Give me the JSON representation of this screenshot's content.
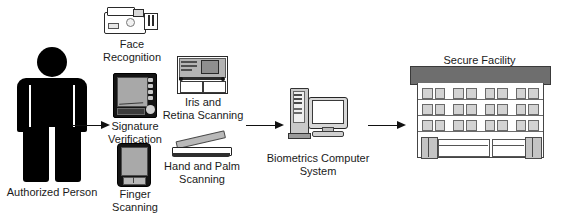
{
  "diagram": {
    "nodes": {
      "person": {
        "label": "Authorized Person",
        "icon": "person-silhouette-icon"
      },
      "face": {
        "label": "Face\nRecognition",
        "icon": "camcorder-icon"
      },
      "signature": {
        "label": "Signature\nVerification",
        "icon": "signature-tablet-icon"
      },
      "iris": {
        "label": "Iris and\nRetina Scanning",
        "icon": "iris-scanner-icon"
      },
      "finger": {
        "label": "Finger\nScanning",
        "icon": "finger-scanner-icon"
      },
      "palm": {
        "label": "Hand and Palm\nScanning",
        "icon": "flatbed-scanner-icon"
      },
      "computer": {
        "label": "Biometrics Computer\nSystem",
        "icon": "desktop-computer-icon"
      },
      "facility": {
        "label": "Secure Facility",
        "icon": "office-building-icon"
      }
    },
    "arrows": [
      {
        "name": "arrow-person-to-biometrics",
        "direction": "right"
      },
      {
        "name": "arrow-biometrics-to-computer",
        "direction": "right"
      },
      {
        "name": "arrow-computer-to-facility",
        "direction": "right"
      }
    ],
    "colors": {
      "ink": "#1a1a1a",
      "silhouette": "#000000",
      "roof": "#6e6e6e",
      "window": "#d3d3d3",
      "device_dark": "#141414",
      "device_gray": "#a9a9a9",
      "background": "#ffffff"
    }
  }
}
